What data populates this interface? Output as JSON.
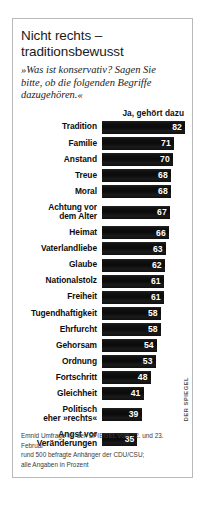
{
  "infographic": {
    "title_lines": [
      "Nicht rechts –",
      "traditionsbewusst"
    ],
    "subtitle_lines": [
      "»Was ist konservativ? Sagen Sie",
      "bitte, ob die folgenden Begriffe",
      "dazugehören.«"
    ],
    "column_header": "Ja, gehört dazu",
    "credit": "DER SPIEGEL",
    "footnote_lines": [
      "Emnid Umfrage für den SPIEGEL vom 22. und 23. Februar",
      "rund 500 befragte Anhänger der CDU/CSU;",
      "alle Angaben in Prozent"
    ],
    "colors": {
      "bar": "#111111",
      "frame": "#b9b9b9",
      "background": "#ffffff",
      "value_text": "#ffffff"
    }
  },
  "chart_data": {
    "type": "bar",
    "orientation": "horizontal",
    "title": "Nicht rechts – traditionsbewusst",
    "subtitle": "»Was ist konservativ? Sagen Sie bitte, ob die folgenden Begriffe dazugehören.«",
    "xlabel": "",
    "ylabel": "",
    "series_name": "Ja, gehört dazu",
    "unit": "Prozent",
    "xlim": [
      0,
      82
    ],
    "grid": false,
    "legend": "none",
    "categories": [
      "Tradition",
      "Familie",
      "Anstand",
      "Treue",
      "Moral",
      "Achtung vor dem Alter",
      "Heimat",
      "Vaterlandliebe",
      "Glaube",
      "Nationalstolz",
      "Freiheit",
      "Tugendhaftigkeit",
      "Ehrfurcht",
      "Gehorsam",
      "Ordnung",
      "Fortschritt",
      "Gleichheit",
      "Politisch eher »rechts«",
      "Angst vor Veränderungen"
    ],
    "values": [
      82,
      71,
      70,
      68,
      68,
      67,
      66,
      63,
      62,
      61,
      61,
      58,
      58,
      54,
      53,
      48,
      41,
      39,
      35
    ],
    "rows": [
      {
        "label_lines": [
          "Tradition"
        ],
        "value": 82,
        "pct": 100.0
      },
      {
        "label_lines": [
          "Familie"
        ],
        "value": 71,
        "pct": 86.6
      },
      {
        "label_lines": [
          "Anstand"
        ],
        "value": 70,
        "pct": 85.4
      },
      {
        "label_lines": [
          "Treue"
        ],
        "value": 68,
        "pct": 82.9
      },
      {
        "label_lines": [
          "Moral"
        ],
        "value": 68,
        "pct": 82.9
      },
      {
        "label_lines": [
          "Achtung vor",
          "dem Alter"
        ],
        "value": 67,
        "pct": 81.7
      },
      {
        "label_lines": [
          "Heimat"
        ],
        "value": 66,
        "pct": 80.5
      },
      {
        "label_lines": [
          "Vaterlandliebe"
        ],
        "value": 63,
        "pct": 76.8
      },
      {
        "label_lines": [
          "Glaube"
        ],
        "value": 62,
        "pct": 75.6
      },
      {
        "label_lines": [
          "Nationalstolz"
        ],
        "value": 61,
        "pct": 74.4
      },
      {
        "label_lines": [
          "Freiheit"
        ],
        "value": 61,
        "pct": 74.4
      },
      {
        "label_lines": [
          "Tugendhaftigkeit"
        ],
        "value": 58,
        "pct": 70.7
      },
      {
        "label_lines": [
          "Ehrfurcht"
        ],
        "value": 58,
        "pct": 70.7
      },
      {
        "label_lines": [
          "Gehorsam"
        ],
        "value": 54,
        "pct": 65.9
      },
      {
        "label_lines": [
          "Ordnung"
        ],
        "value": 53,
        "pct": 64.6
      },
      {
        "label_lines": [
          "Fortschritt"
        ],
        "value": 48,
        "pct": 58.5
      },
      {
        "label_lines": [
          "Gleichheit"
        ],
        "value": 41,
        "pct": 50.0
      },
      {
        "label_lines": [
          "Politisch",
          "eher »rechts«"
        ],
        "value": 39,
        "pct": 47.6
      },
      {
        "label_lines": [
          "Angst vor",
          "Veränderungen"
        ],
        "value": 35,
        "pct": 42.7
      }
    ]
  }
}
